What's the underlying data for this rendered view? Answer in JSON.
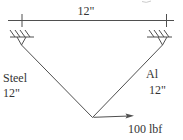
{
  "diagram": {
    "type": "truss-statics-figure",
    "top_dimension_label": "12\"",
    "left_member": {
      "material": "Steel",
      "length": "12\""
    },
    "right_member": {
      "material": "Al",
      "length": "12\""
    },
    "force": {
      "label": "100 lbf",
      "direction": "right"
    },
    "colors": {
      "line": "#4f4f4f",
      "text": "#343434",
      "background": "#ffffff"
    }
  }
}
